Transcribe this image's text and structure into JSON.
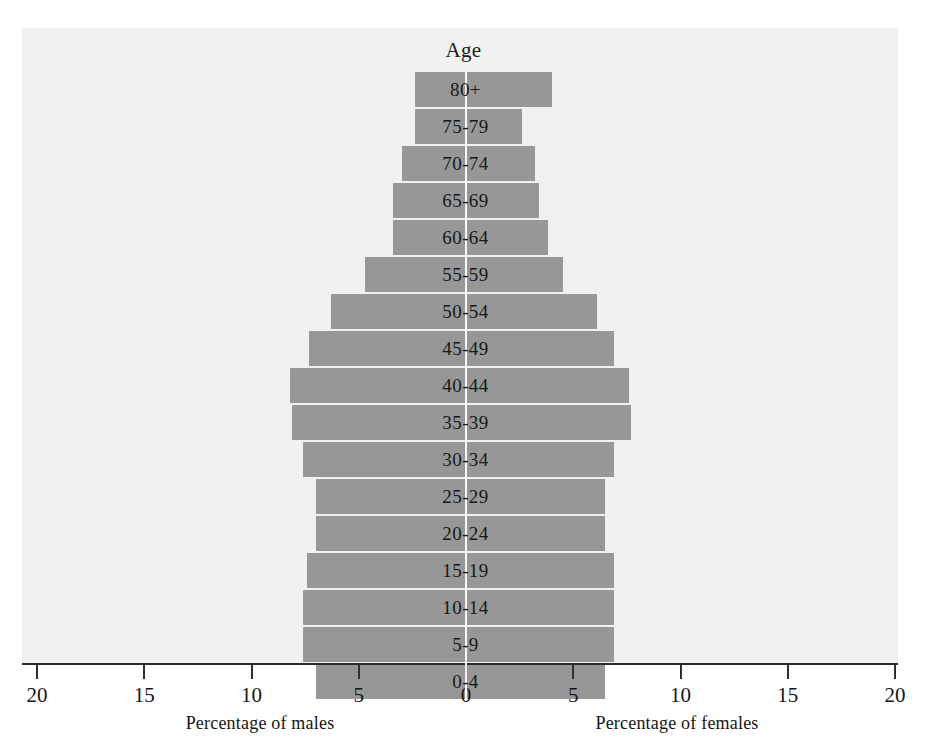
{
  "chart_data": {
    "type": "bar",
    "subtype": "population-pyramid",
    "title": "Age",
    "xlabel_left": "Percentage of males",
    "xlabel_right": "Percentage of females",
    "ylabel": "Age",
    "grid": false,
    "legend": "none",
    "xlim": [
      -20,
      20
    ],
    "axis_ticks": [
      "20",
      "15",
      "10",
      "5",
      "0",
      "5",
      "10",
      "15",
      "20"
    ],
    "axis_tick_values": [
      -20,
      -15,
      -10,
      -5,
      0,
      5,
      10,
      15,
      20
    ],
    "categories": [
      "80+",
      "75-79",
      "70-74",
      "65-69",
      "60-64",
      "55-59",
      "50-54",
      "45-49",
      "40-44",
      "35-39",
      "30-34",
      "25-29",
      "20-24",
      "15-19",
      "10-14",
      "5-9",
      "0-4"
    ],
    "series": [
      {
        "name": "Percentage of males",
        "side": "left",
        "values": [
          2.4,
          2.4,
          3.0,
          3.4,
          3.4,
          4.7,
          6.3,
          7.3,
          8.2,
          8.1,
          7.6,
          7.0,
          7.0,
          7.4,
          7.6,
          7.6,
          7.0
        ]
      },
      {
        "name": "Percentage of females",
        "side": "right",
        "values": [
          4.0,
          2.6,
          3.2,
          3.4,
          3.8,
          4.5,
          6.1,
          6.9,
          7.6,
          7.7,
          6.9,
          6.5,
          6.5,
          6.9,
          6.9,
          6.9,
          6.5
        ]
      }
    ],
    "colors": {
      "bar": "#a2a2a2",
      "panel_background": "#f1f1f1",
      "axis": "#2b2b2b",
      "text": "#141414",
      "center_divider": "#ffffff"
    }
  }
}
